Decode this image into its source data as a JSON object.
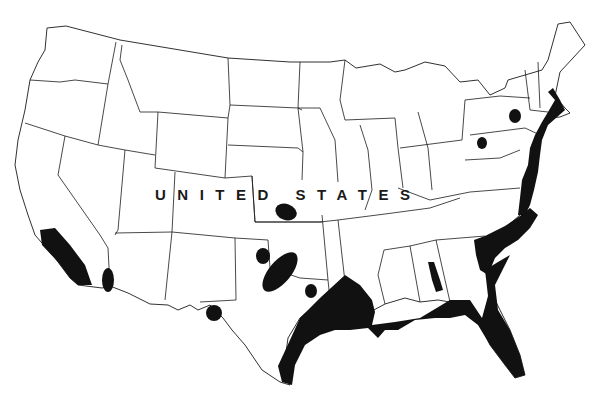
{
  "map": {
    "country_label": "UNITED STATES",
    "style": "black-and-white outline map of the contiguous United States with state boundaries",
    "colors": {
      "background": "#ffffff",
      "outline": "#1a1a1a",
      "shaded_region": "#111111"
    },
    "shaded_regions": [
      {
        "id": "southern-california-coast",
        "description": "Southern California coastal strip"
      },
      {
        "id": "lower-colorado-river",
        "description": "Small area along lower Colorado River near AZ/CA border"
      },
      {
        "id": "west-texas-el-paso",
        "description": "Small circular area near El Paso, far west Texas"
      },
      {
        "id": "western-oklahoma",
        "description": "Small oval in western Oklahoma"
      },
      {
        "id": "red-river-ok-tx",
        "description": "Elongated oval straddling Oklahoma–Texas Red River border"
      },
      {
        "id": "north-central-texas",
        "description": "Small oval in north-central Texas"
      },
      {
        "id": "central-kansas",
        "description": "Oval in central Kansas"
      },
      {
        "id": "gulf-coast",
        "description": "Broad Gulf Coast band from south Texas through Louisiana, Mississippi, Alabama to Florida panhandle"
      },
      {
        "id": "florida-peninsula",
        "description": "Florida peninsula"
      },
      {
        "id": "atlantic-coastal-plain",
        "description": "Atlantic coastal plain from Georgia through Carolinas and Virginia"
      },
      {
        "id": "mid-atlantic-northeast-coast",
        "description": "Coastal strip through Maryland, Delaware, New Jersey, New York to Massachusetts"
      },
      {
        "id": "central-alabama",
        "description": "Elongated area in central Alabama"
      },
      {
        "id": "western-pennsylvania",
        "description": "Small circle in western Pennsylvania"
      },
      {
        "id": "eastern-new-york",
        "description": "Small oval in eastern New York"
      }
    ]
  }
}
